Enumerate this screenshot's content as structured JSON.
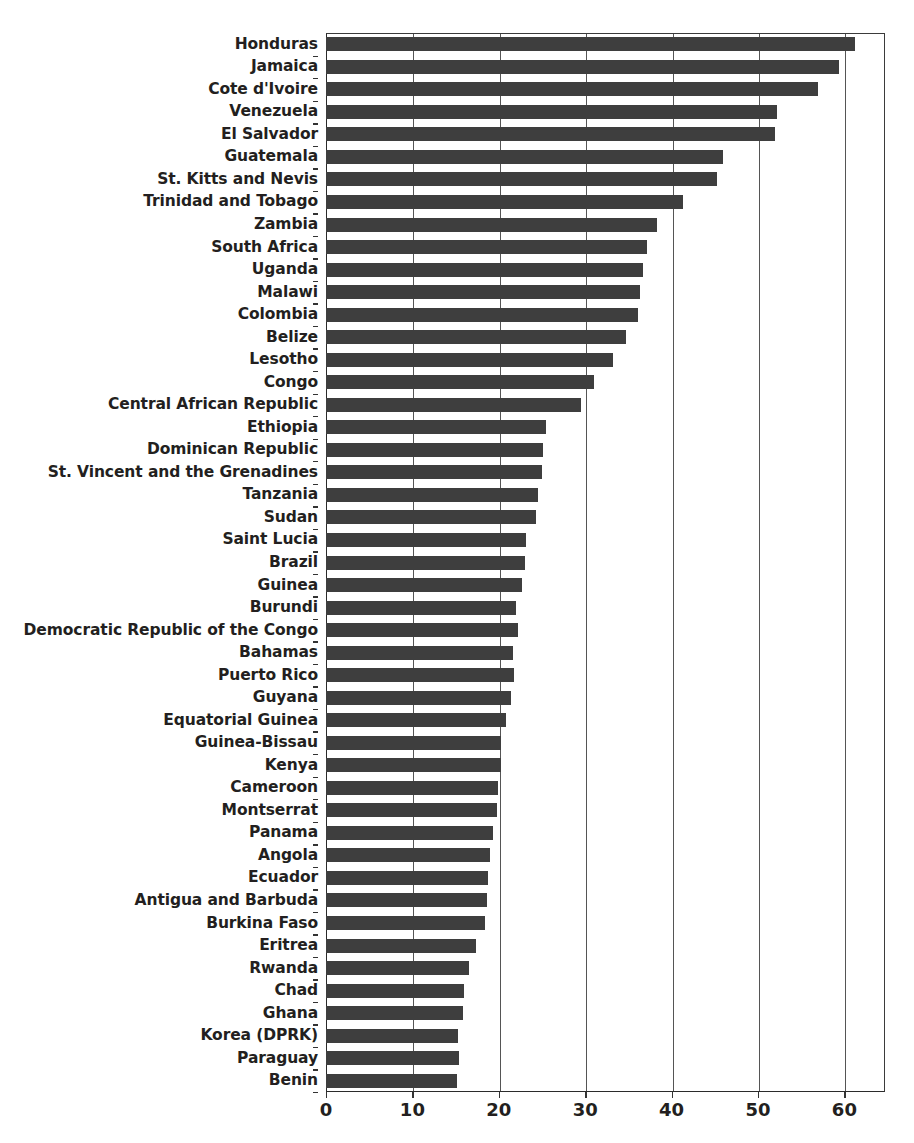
{
  "chart_data": {
    "type": "bar",
    "orientation": "horizontal",
    "title": "",
    "subtitle": "",
    "xlabel": "",
    "ylabel": "",
    "xlim": [
      0,
      64.7
    ],
    "ylim": null,
    "grid": "vertical-only",
    "legend": "none",
    "bar_color": "#3e3e3e",
    "background_color": "#ffffff",
    "axis_color": "#2b2b2b",
    "xticks": [
      0,
      10,
      20,
      30,
      40,
      50,
      60
    ],
    "xtick_labels": [
      "0",
      "10",
      "20",
      "30",
      "40",
      "50",
      "60"
    ],
    "categories": [
      "Honduras",
      "Jamaica",
      "Cote d'Ivoire",
      "Venezuela",
      "El Salvador",
      "Guatemala",
      "St. Kitts and Nevis",
      "Trinidad and Tobago",
      "Zambia",
      "South Africa",
      "Uganda",
      "Malawi",
      "Colombia",
      "Belize",
      "Lesotho",
      "Congo",
      "Central African Republic",
      "Ethiopia",
      "Dominican Republic",
      "St. Vincent and the Grenadines",
      "Tanzania",
      "Sudan",
      "Saint Lucia",
      "Brazil",
      "Guinea",
      "Burundi",
      "Democratic Republic of the Congo",
      "Bahamas",
      "Puerto Rico",
      "Guyana",
      "Equatorial Guinea",
      "Guinea-Bissau",
      "Kenya",
      "Cameroon",
      "Montserrat",
      "Panama",
      "Angola",
      "Ecuador",
      "Antigua and Barbuda",
      "Burkina Faso",
      "Eritrea",
      "Rwanda",
      "Chad",
      "Ghana",
      "Korea (DPRK)",
      "Paraguay",
      "Benin"
    ],
    "values": [
      61.2,
      59.4,
      57.0,
      52.2,
      52.0,
      46.0,
      45.2,
      41.3,
      38.3,
      37.1,
      36.7,
      36.3,
      36.1,
      34.7,
      33.2,
      31.0,
      29.5,
      25.5,
      25.1,
      25.0,
      24.5,
      24.3,
      23.2,
      23.0,
      22.7,
      22.0,
      22.2,
      21.7,
      21.8,
      21.4,
      20.8,
      20.3,
      20.2,
      19.9,
      19.8,
      19.3,
      19.0,
      18.8,
      18.6,
      18.4,
      17.4,
      16.6,
      16.0,
      15.9,
      15.3,
      15.4,
      15.2
    ]
  }
}
